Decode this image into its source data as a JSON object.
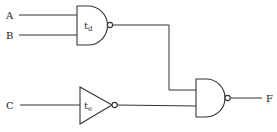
{
  "diagram": {
    "type": "logic-circuit",
    "inputs": [
      {
        "label": "A"
      },
      {
        "label": "B"
      },
      {
        "label": "C"
      }
    ],
    "gates": [
      {
        "kind": "NAND",
        "label": "t",
        "sub": "d",
        "inputs": [
          "A",
          "B"
        ]
      },
      {
        "kind": "NOT",
        "label": "t",
        "sub": "e",
        "inputs": [
          "C"
        ]
      },
      {
        "kind": "NAND",
        "label": "",
        "sub": "",
        "inputs": [
          "gate1",
          "gate2"
        ]
      }
    ],
    "output": {
      "label": "F"
    },
    "colors": {
      "line": "#333333",
      "background": "#ffffff"
    }
  }
}
